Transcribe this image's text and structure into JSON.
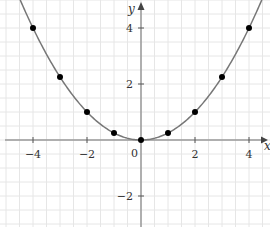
{
  "chart_data": {
    "type": "line",
    "title": "",
    "function": "y = x^2 / 4",
    "xlabel": "x",
    "ylabel": "y",
    "xlim": [
      -5.1,
      4.7
    ],
    "ylim": [
      -3.0,
      5.1
    ],
    "x_ticks": [
      -4,
      -2,
      0,
      2,
      4
    ],
    "y_ticks": [
      -2,
      2,
      4
    ],
    "x_tick_labels": [
      "−4",
      "−2",
      "0",
      "2",
      "4"
    ],
    "y_tick_labels": [
      "−2",
      "2",
      "4"
    ],
    "grid": true,
    "grid_minor_step": 0.5,
    "legend": null,
    "points": {
      "x": [
        -4,
        -3,
        -2,
        -1,
        0,
        1,
        2,
        3,
        4
      ],
      "y": [
        4,
        2.25,
        1,
        0.25,
        0,
        0.25,
        1,
        2.25,
        4
      ]
    },
    "curve": {
      "x_range": [
        -4.7,
        4.7
      ],
      "arrows_at_ends": true
    },
    "colors": {
      "curve": "#777777",
      "points": "#000000",
      "axes": "#999999",
      "grid": "#e6e6e6"
    }
  },
  "labels": {
    "x_axis": "x",
    "y_axis": "y",
    "origin": "0"
  }
}
